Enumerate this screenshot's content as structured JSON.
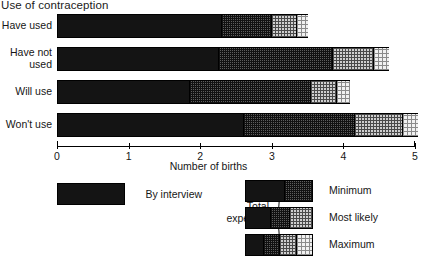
{
  "chart_data": {
    "type": "bar",
    "orientation": "horizontal",
    "stacked": true,
    "title": "Use of contraception",
    "xlabel": "Number of births",
    "ylabel": "",
    "xlim": [
      0,
      5
    ],
    "xticks": [
      0,
      1,
      2,
      3,
      4,
      5
    ],
    "xticklabels": [
      "0",
      "1",
      "2",
      "3",
      "4",
      "5"
    ],
    "grid": false,
    "legend_position": "bottom",
    "categories": [
      "Have used",
      "Have not used",
      "Will use",
      "Won't use"
    ],
    "series": [
      {
        "name": "By interview",
        "key": "by_interview",
        "pattern": "solid-black",
        "values": [
          2.3,
          2.25,
          1.84,
          2.6
        ]
      },
      {
        "name": "Minimum",
        "key": "minimum",
        "pattern": "dense-crosshatch",
        "values": [
          3.0,
          3.85,
          3.55,
          4.16
        ]
      },
      {
        "name": "Most likely",
        "key": "most_likely",
        "pattern": "medium-checker",
        "values": [
          3.35,
          4.43,
          3.91,
          4.83
        ]
      },
      {
        "name": "Maximum",
        "key": "maximum",
        "pattern": "sparse-dots",
        "values": [
          3.5,
          4.64,
          4.09,
          5.04
        ]
      }
    ],
    "bars": [
      {
        "category": "Have used",
        "by_interview": 2.3,
        "minimum": 3.0,
        "most_likely": 3.35,
        "maximum": 3.5
      },
      {
        "category": "Have not used",
        "by_interview": 2.25,
        "minimum": 3.85,
        "most_likely": 4.43,
        "maximum": 4.64
      },
      {
        "category": "Will use",
        "by_interview": 1.84,
        "minimum": 3.55,
        "most_likely": 3.91,
        "maximum": 4.09
      },
      {
        "category": "Won't use",
        "by_interview": 2.6,
        "minimum": 4.16,
        "most_likely": 4.83,
        "maximum": 5.04
      }
    ],
    "colors": {
      "solid_black": "#141414",
      "dense_crosshatch": "#5d5d5d",
      "medium_checker": "#cfcfcf",
      "sparse_dots": "#f1f1f1",
      "axis": "#000000",
      "background": "#ffffff"
    }
  },
  "legend": {
    "interview_label": "By interview",
    "group_label_line1": "Total",
    "group_label_line2": "expected",
    "entries": [
      {
        "label": "Minimum"
      },
      {
        "label": "Most likely"
      },
      {
        "label": "Maximum"
      }
    ]
  }
}
